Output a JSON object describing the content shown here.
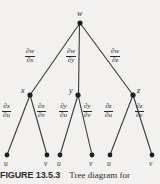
{
  "figure": {
    "caption_label": "FIGURE 13.5.3",
    "caption_text": "Tree diagram for",
    "background_color": "#f2f1ef",
    "ink_color": "#2b2b2b"
  },
  "tree": {
    "root": {
      "label": "w",
      "x": 80,
      "y": 23
    },
    "level1": [
      {
        "label": "x",
        "x": 30,
        "y": 95
      },
      {
        "label": "y",
        "x": 78,
        "y": 95
      },
      {
        "label": "z",
        "x": 133,
        "y": 95
      }
    ],
    "leaves": [
      {
        "label": "u",
        "x": 7,
        "y": 155
      },
      {
        "label": "v",
        "x": 47,
        "y": 155
      },
      {
        "label": "u",
        "x": 60,
        "y": 155
      },
      {
        "label": "v",
        "x": 92,
        "y": 155
      },
      {
        "label": "u",
        "x": 110,
        "y": 155
      },
      {
        "label": "v",
        "x": 152,
        "y": 155
      }
    ],
    "edge_labels_top": [
      {
        "numerator": "∂w",
        "denominator": "∂x",
        "x": 38,
        "y": 55
      },
      {
        "numerator": "∂w",
        "denominator": "∂y",
        "x": 79,
        "y": 55
      },
      {
        "numerator": "∂w",
        "denominator": "∂z",
        "x": 122,
        "y": 55
      }
    ],
    "edge_labels_bottom": [
      {
        "numerator": "∂x",
        "denominator": "∂u",
        "x": 13,
        "y": 110
      },
      {
        "numerator": "∂x",
        "denominator": "∂v",
        "x": 48,
        "y": 110
      },
      {
        "numerator": "∂y",
        "denominator": "∂u",
        "x": 70,
        "y": 110
      },
      {
        "numerator": "∂y",
        "denominator": "∂v",
        "x": 94,
        "y": 110
      },
      {
        "numerator": "∂z",
        "denominator": "∂u",
        "x": 115,
        "y": 110
      },
      {
        "numerator": "∂z",
        "denominator": "∂v",
        "x": 146,
        "y": 110
      }
    ]
  }
}
